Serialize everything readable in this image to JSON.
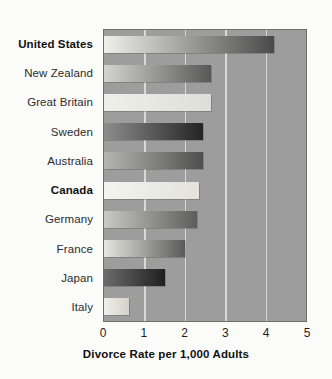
{
  "chart_data": {
    "type": "bar",
    "orientation": "horizontal",
    "title": "",
    "xlabel": "Divorce Rate per 1,000 Adults",
    "ylabel": "",
    "xlim": [
      0,
      5
    ],
    "xticks": [
      "0",
      "1",
      "2",
      "3",
      "4",
      "5"
    ],
    "grid": true,
    "legend": "none",
    "categories": [
      "United States",
      "New Zealand",
      "Great Britain",
      "Sweden",
      "Australia",
      "Canada",
      "Germany",
      "France",
      "Japan",
      "Italy"
    ],
    "values": [
      4.2,
      2.65,
      2.65,
      2.45,
      2.45,
      2.35,
      2.3,
      2.0,
      1.5,
      0.62
    ],
    "emphasized": [
      "United States",
      "Canada"
    ],
    "bars": [
      {
        "label": "United States",
        "value": 4.2,
        "bold": true,
        "fill_start": "#efefec",
        "fill_end": "#4a4a4a"
      },
      {
        "label": "New Zealand",
        "value": 2.65,
        "bold": false,
        "fill_start": "#d3d3cf",
        "fill_end": "#585858"
      },
      {
        "label": "Great Britain",
        "value": 2.65,
        "bold": false,
        "fill_start": "#efefea",
        "fill_end": "#dedeD8"
      },
      {
        "label": "Sweden",
        "value": 2.45,
        "bold": false,
        "fill_start": "#8d8d8d",
        "fill_end": "#242424"
      },
      {
        "label": "Australia",
        "value": 2.45,
        "bold": false,
        "fill_start": "#b5b5b1",
        "fill_end": "#4f4f4f"
      },
      {
        "label": "Canada",
        "value": 2.35,
        "bold": true,
        "fill_start": "#f4f4ef",
        "fill_end": "#e3e3dc"
      },
      {
        "label": "Germany",
        "value": 2.3,
        "bold": false,
        "fill_start": "#c8c8c4",
        "fill_end": "#5d5d5d"
      },
      {
        "label": "France",
        "value": 2.0,
        "bold": false,
        "fill_start": "#e6e6e0",
        "fill_end": "#5a5a5a"
      },
      {
        "label": "Japan",
        "value": 1.5,
        "bold": false,
        "fill_start": "#6b6b6b",
        "fill_end": "#1f1f1f"
      },
      {
        "label": "Italy",
        "value": 0.62,
        "bold": false,
        "fill_start": "#f0f0ea",
        "fill_end": "#d2d2cb"
      }
    ],
    "colors": {
      "plot_background": "#9d9d9d",
      "page_background": "#fbfbfa",
      "gridline": "#d8d8d4",
      "axis_border": "#6f6f6f",
      "text": "#1f1f1f"
    }
  }
}
